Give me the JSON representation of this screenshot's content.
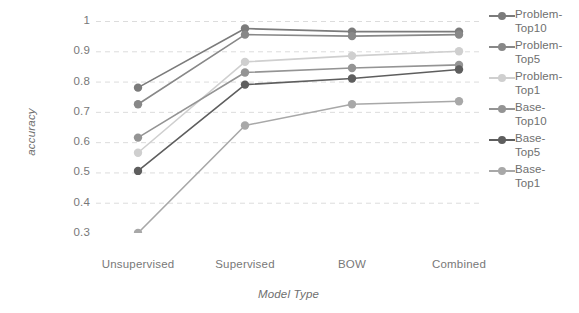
{
  "chart_data": {
    "type": "line",
    "title": "",
    "xlabel": "Model Type",
    "ylabel": "accuracy",
    "categories": [
      "Unsupervised",
      "Supervised",
      "BOW",
      "Combined"
    ],
    "ylim": [
      0.3,
      1.0
    ],
    "yticks": [
      0.3,
      0.4,
      0.5,
      0.6,
      0.7,
      0.8,
      0.9,
      1.0
    ],
    "ytick_labels": [
      "0.3",
      "0.4",
      "0.5",
      "0.6",
      "0.7",
      "0.8",
      "0.9",
      "1"
    ],
    "grid": "horizontal-dashed",
    "legend_position": "right",
    "series": [
      {
        "name": "Problem-Top10",
        "legend_label": "Problem-\nTop10",
        "color": "#7b7b7b",
        "values": [
          0.78,
          0.975,
          0.965,
          0.965
        ]
      },
      {
        "name": "Problem-Top5",
        "legend_label": "Problem-\nTop5",
        "color": "#888888",
        "values": [
          0.725,
          0.955,
          0.95,
          0.955
        ]
      },
      {
        "name": "Problem-Top1",
        "legend_label": "Problem-\nTop1",
        "color": "#cfcfcf",
        "values": [
          0.565,
          0.865,
          0.885,
          0.9
        ]
      },
      {
        "name": "Base-Top10",
        "legend_label": "Base-\nTop10",
        "color": "#949494",
        "values": [
          0.615,
          0.83,
          0.845,
          0.855
        ]
      },
      {
        "name": "Base-Top5",
        "legend_label": "Base-\nTop5",
        "color": "#5e5e5e",
        "values": [
          0.505,
          0.79,
          0.81,
          0.84
        ]
      },
      {
        "name": "Base-Top1",
        "legend_label": "Base-\nTop1",
        "color": "#a8a8a8",
        "values": [
          0.3,
          0.655,
          0.725,
          0.735
        ]
      }
    ]
  },
  "axes": {
    "y_title": "accuracy",
    "x_title": "Model Type"
  }
}
